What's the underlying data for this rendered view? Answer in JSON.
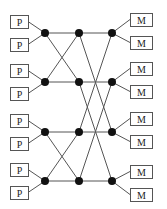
{
  "diagram": {
    "title": "",
    "processors": [
      {
        "label": "P",
        "x": 10,
        "y": 15
      },
      {
        "label": "P",
        "x": 10,
        "y": 38
      },
      {
        "label": "P",
        "x": 10,
        "y": 64
      },
      {
        "label": "P",
        "x": 10,
        "y": 87
      },
      {
        "label": "P",
        "x": 10,
        "y": 114
      },
      {
        "label": "P",
        "x": 10,
        "y": 137
      },
      {
        "label": "P",
        "x": 10,
        "y": 163
      },
      {
        "label": "P",
        "x": 10,
        "y": 186
      }
    ],
    "memories": [
      {
        "label": "M",
        "x": 130,
        "y": 13
      },
      {
        "label": "M",
        "x": 130,
        "y": 36
      },
      {
        "label": "M",
        "x": 130,
        "y": 62
      },
      {
        "label": "M",
        "x": 130,
        "y": 85
      },
      {
        "label": "M",
        "x": 130,
        "y": 112
      },
      {
        "label": "M",
        "x": 130,
        "y": 135
      },
      {
        "label": "M",
        "x": 130,
        "y": 165
      },
      {
        "label": "M",
        "x": 130,
        "y": 188
      }
    ],
    "box_size": {
      "p_w": 18,
      "p_h": 13,
      "m_w": 22,
      "m_h": 13
    },
    "switch_columns": [
      {
        "x": 45,
        "ys": [
          33,
          82,
          132,
          181
        ]
      },
      {
        "x": 79,
        "ys": [
          33,
          82,
          132,
          181
        ]
      },
      {
        "x": 112,
        "ys": [
          33,
          82,
          132,
          181
        ]
      }
    ],
    "stage1_links": [
      [
        0,
        0
      ],
      [
        0,
        1
      ],
      [
        1,
        1
      ],
      [
        1,
        0
      ],
      [
        2,
        2
      ],
      [
        2,
        3
      ],
      [
        3,
        3
      ],
      [
        3,
        2
      ]
    ],
    "stage2_links": [
      [
        0,
        0
      ],
      [
        0,
        2
      ],
      [
        1,
        1
      ],
      [
        1,
        3
      ],
      [
        2,
        2
      ],
      [
        2,
        0
      ],
      [
        3,
        3
      ],
      [
        3,
        1
      ]
    ],
    "colors": {
      "node": "#111111",
      "wire": "#555555",
      "box_border": "#555555"
    }
  }
}
